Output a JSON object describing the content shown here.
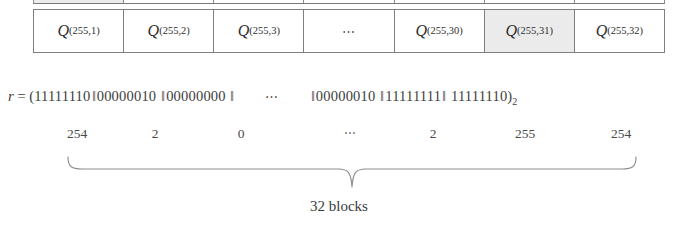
{
  "figure": {
    "type": "block-partition-diagram",
    "caption": "32 blocks",
    "table": {
      "shaded_cell_index": 6,
      "cells": [
        {
          "symbol": "Q",
          "subscript": "(255,1)",
          "is_ellipsis": false
        },
        {
          "symbol": "Q",
          "subscript": "(255,2)",
          "is_ellipsis": false
        },
        {
          "symbol": "Q",
          "subscript": "(255,3)",
          "is_ellipsis": false
        },
        {
          "symbol": "",
          "subscript": "",
          "is_ellipsis": true,
          "text": "⋯"
        },
        {
          "symbol": "Q",
          "subscript": "(255,30)",
          "is_ellipsis": false
        },
        {
          "symbol": "Q",
          "subscript": "(255,31)",
          "is_ellipsis": false
        },
        {
          "symbol": "Q",
          "subscript": "(255,32)",
          "is_ellipsis": false
        }
      ]
    },
    "expression": {
      "variable": "r",
      "equals": "=",
      "open_paren": "(",
      "close_paren": ")",
      "base_subscript": "2",
      "separator": "‖",
      "ellipsis": "⋯",
      "blocks": [
        "11111110",
        "00000010",
        "00000000",
        "00000010",
        "11111111",
        "11111110"
      ]
    },
    "decimals": [
      {
        "value": "254",
        "x": 44,
        "is_ellipsis": false
      },
      {
        "value": "2",
        "x": 122,
        "is_ellipsis": false
      },
      {
        "value": "0",
        "x": 208,
        "is_ellipsis": false
      },
      {
        "value": "⋯",
        "x": 318,
        "is_ellipsis": true
      },
      {
        "value": "2",
        "x": 400,
        "is_ellipsis": false
      },
      {
        "value": "255",
        "x": 492,
        "is_ellipsis": false
      },
      {
        "value": "254",
        "x": 588,
        "is_ellipsis": false
      }
    ],
    "colors": {
      "background": "#ffffff",
      "text": "#3a3a3a",
      "border": "#7f7f7f",
      "shaded_cell": "#ebebeb",
      "brace": "#8d8d8d"
    }
  }
}
